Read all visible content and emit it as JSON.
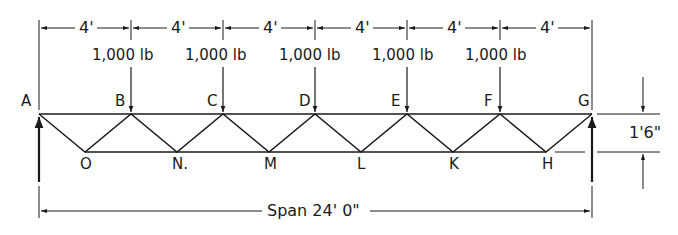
{
  "diagram": {
    "type": "warren-truss",
    "top_nodes": [
      {
        "label": "A",
        "x": 39
      },
      {
        "label": "B",
        "x": 131
      },
      {
        "label": "C",
        "x": 223
      },
      {
        "label": "D",
        "x": 315
      },
      {
        "label": "E",
        "x": 407
      },
      {
        "label": "F",
        "x": 500
      },
      {
        "label": "G",
        "x": 592
      }
    ],
    "bottom_nodes": [
      {
        "label": "O",
        "x": 85
      },
      {
        "label": "N.",
        "x": 177
      },
      {
        "label": "M",
        "x": 269
      },
      {
        "label": "L",
        "x": 361
      },
      {
        "label": "K",
        "x": 453
      },
      {
        "label": "H",
        "x": 546
      }
    ],
    "panel_dims": [
      "4'",
      "4'",
      "4'",
      "4'",
      "4'",
      "4'"
    ],
    "loads": [
      {
        "at": "B",
        "label": "1,000  lb"
      },
      {
        "at": "C",
        "label": "1,000  lb"
      },
      {
        "at": "D",
        "label": "1,000  lb"
      },
      {
        "at": "E",
        "label": "1,000  lb"
      },
      {
        "at": "F",
        "label": "1,000  lb"
      }
    ],
    "height_dim": "1'6\"",
    "span_label": "Span 24' 0\"",
    "stroke_color": "#1a1a1a"
  }
}
